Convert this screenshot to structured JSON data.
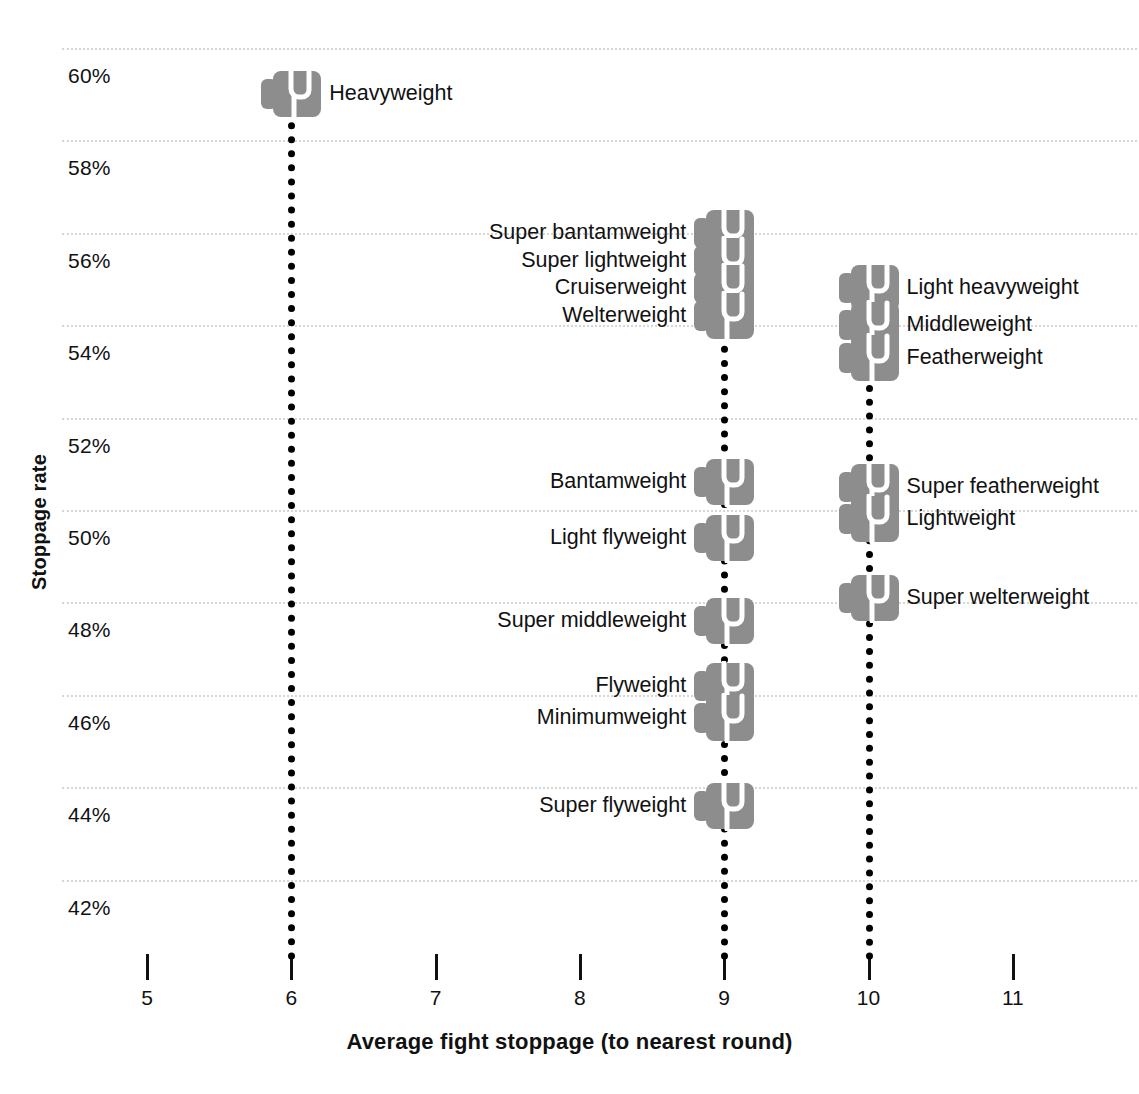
{
  "chart_data": {
    "type": "scatter",
    "title": "",
    "xlabel": "Average fight stoppage (to nearest round)",
    "ylabel": "Stoppage rate",
    "xlim": [
      4.7,
      11.6
    ],
    "ylim": [
      41.2,
      60.9
    ],
    "xticks": [
      5,
      6,
      7,
      8,
      9,
      10,
      11
    ],
    "xtick_labels": [
      "5",
      "6",
      "7",
      "8",
      "9",
      "10",
      "11"
    ],
    "yticks": [
      42,
      44,
      46,
      48,
      50,
      52,
      54,
      56,
      58,
      60
    ],
    "ytick_labels": [
      "42%",
      "44%",
      "46%",
      "48%",
      "50%",
      "52%",
      "54%",
      "56%",
      "58%",
      "60%"
    ],
    "grid": true,
    "grid_axis": "y",
    "grid_style": "dotted",
    "grid_color": "#d6d6d6",
    "marker": "boxing-glove",
    "marker_color": "#8d8d8d",
    "legend": "none",
    "stem_color": "#000000",
    "points": [
      {
        "label": "Heavyweight",
        "x": 6,
        "y": 59.0,
        "label_side": "right"
      },
      {
        "label": "Super bantamweight",
        "x": 9,
        "y": 56.0,
        "label_side": "left"
      },
      {
        "label": "Super lightweight",
        "x": 9,
        "y": 55.4,
        "label_side": "left"
      },
      {
        "label": "Cruiserweight",
        "x": 9,
        "y": 54.8,
        "label_side": "left"
      },
      {
        "label": "Welterweight",
        "x": 9,
        "y": 54.2,
        "label_side": "left"
      },
      {
        "label": "Light heavyweight",
        "x": 10,
        "y": 54.8,
        "label_side": "right"
      },
      {
        "label": "Middleweight",
        "x": 10,
        "y": 54.0,
        "label_side": "right"
      },
      {
        "label": "Featherweight",
        "x": 10,
        "y": 53.3,
        "label_side": "right"
      },
      {
        "label": "Bantamweight",
        "x": 9,
        "y": 50.6,
        "label_side": "left"
      },
      {
        "label": "Light flyweight",
        "x": 9,
        "y": 49.4,
        "label_side": "left"
      },
      {
        "label": "Super featherweight",
        "x": 10,
        "y": 50.5,
        "label_side": "right"
      },
      {
        "label": "Lightweight",
        "x": 10,
        "y": 49.8,
        "label_side": "right"
      },
      {
        "label": "Super middleweight",
        "x": 9,
        "y": 47.6,
        "label_side": "left"
      },
      {
        "label": "Super welterweight",
        "x": 10,
        "y": 48.1,
        "label_side": "right"
      },
      {
        "label": "Flyweight",
        "x": 9,
        "y": 46.2,
        "label_side": "left"
      },
      {
        "label": "Minimumweight",
        "x": 9,
        "y": 45.5,
        "label_side": "left"
      },
      {
        "label": "Super flyweight",
        "x": 9,
        "y": 43.6,
        "label_side": "left"
      }
    ]
  }
}
